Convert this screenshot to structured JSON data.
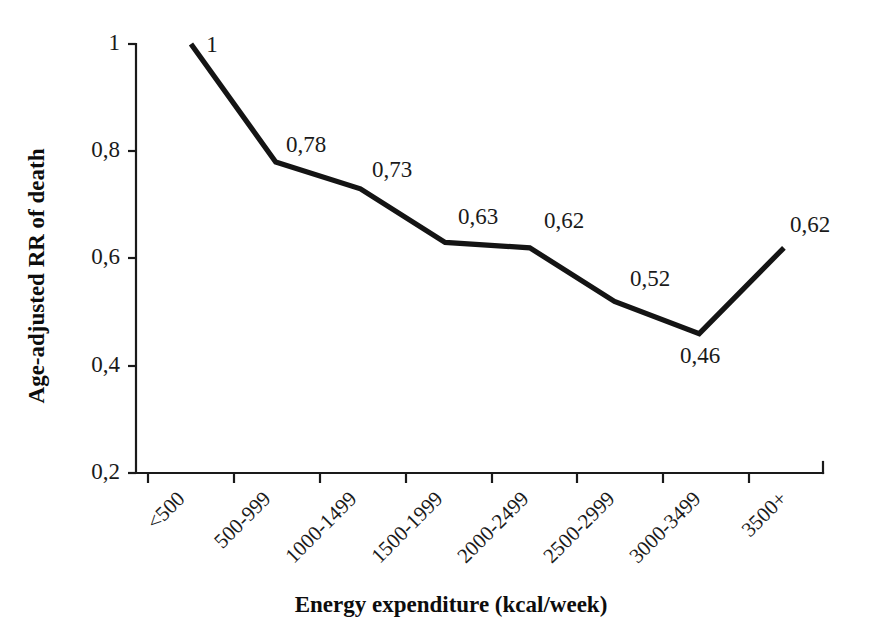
{
  "chart_data": {
    "type": "line",
    "title": "",
    "subtitle": "",
    "xlabel": "Energy expenditure (kcal/week)",
    "ylabel": "Age-adjusted RR of death",
    "categories": [
      "<500",
      "500-999",
      "1000-1499",
      "1500-1999",
      "2000-2499",
      "2500-2999",
      "3000-3499",
      "3500+"
    ],
    "values": [
      1,
      0.78,
      0.73,
      0.63,
      0.62,
      0.52,
      0.46,
      0.62
    ],
    "point_labels": [
      "1",
      "0,78",
      "0,73",
      "0,63",
      "0,62",
      "0,52",
      "0,46",
      "0,62"
    ],
    "ylim": [
      0.2,
      1.0
    ],
    "yticks": [
      1,
      0.8,
      0.6,
      0.4,
      0.2
    ],
    "ytick_labels": [
      "1",
      "0,8",
      "0,6",
      "0,4",
      "0,2"
    ],
    "grid": false,
    "legend": "none",
    "series_color": "#141414",
    "axis_color": "#1a1a1a",
    "background_color": "#ffffff"
  }
}
